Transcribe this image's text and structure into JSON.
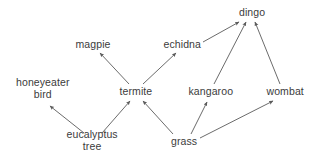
{
  "diagram": {
    "type": "directed-graph",
    "background_color": "#ffffff",
    "text_color": "#3b3b3b",
    "edge_color": "#5a5a5a",
    "canvas": {
      "width": 316,
      "height": 163
    },
    "nodes": [
      {
        "id": "magpie",
        "label": "magpie",
        "label_line2": "",
        "cx": 93,
        "cy": 45
      },
      {
        "id": "echidna",
        "label": "echidna",
        "label_line2": "",
        "cx": 182,
        "cy": 45
      },
      {
        "id": "dingo",
        "label": "dingo",
        "label_line2": "",
        "cx": 252,
        "cy": 13
      },
      {
        "id": "honeyeater-bird",
        "label": "honeyeater",
        "label_line2": "bird",
        "cx": 43,
        "cy": 89
      },
      {
        "id": "termite",
        "label": "termite",
        "label_line2": "",
        "cx": 136,
        "cy": 92
      },
      {
        "id": "kangaroo",
        "label": "kangaroo",
        "label_line2": "",
        "cx": 211,
        "cy": 92
      },
      {
        "id": "wombat",
        "label": "wombat",
        "label_line2": "",
        "cx": 285,
        "cy": 92
      },
      {
        "id": "eucalyptus-tree",
        "label": "eucalyptus",
        "label_line2": "tree",
        "cx": 92,
        "cy": 141
      },
      {
        "id": "grass",
        "label": "grass",
        "label_line2": "",
        "cx": 184,
        "cy": 142
      }
    ],
    "edges": [
      {
        "from": "termite",
        "to": "magpie",
        "x1": 129,
        "y1": 84,
        "x2": 100,
        "y2": 53
      },
      {
        "from": "termite",
        "to": "echidna",
        "x1": 143,
        "y1": 84,
        "x2": 176,
        "y2": 53
      },
      {
        "from": "echidna",
        "to": "dingo",
        "x1": 203,
        "y1": 42,
        "x2": 239,
        "y2": 22
      },
      {
        "from": "kangaroo",
        "to": "dingo",
        "x1": 214,
        "y1": 84,
        "x2": 246,
        "y2": 22
      },
      {
        "from": "wombat",
        "to": "dingo",
        "x1": 280,
        "y1": 84,
        "x2": 255,
        "y2": 22
      },
      {
        "from": "eucalyptus-tree",
        "to": "honeyeater-bird",
        "x1": 84,
        "y1": 133,
        "x2": 50,
        "y2": 106
      },
      {
        "from": "eucalyptus-tree",
        "to": "termite",
        "x1": 102,
        "y1": 133,
        "x2": 130,
        "y2": 101
      },
      {
        "from": "grass",
        "to": "termite",
        "x1": 173,
        "y1": 134,
        "x2": 143,
        "y2": 101
      },
      {
        "from": "grass",
        "to": "kangaroo",
        "x1": 191,
        "y1": 134,
        "x2": 207,
        "y2": 102
      },
      {
        "from": "grass",
        "to": "wombat",
        "x1": 200,
        "y1": 138,
        "x2": 273,
        "y2": 101
      }
    ]
  }
}
